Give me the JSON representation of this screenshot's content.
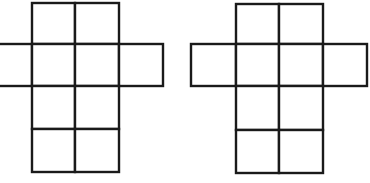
{
  "diagram": {
    "stroke_color": "#1a1a1a",
    "background_color": "#ffffff",
    "figures": [
      {
        "name": "net-left",
        "cells": [
          {
            "x": 32,
            "y": 3,
            "w": 43,
            "h": 41
          },
          {
            "x": 75,
            "y": 3,
            "w": 44,
            "h": 41
          },
          {
            "x": -2,
            "y": 44,
            "w": 34,
            "h": 42
          },
          {
            "x": 32,
            "y": 44,
            "w": 43,
            "h": 42
          },
          {
            "x": 75,
            "y": 44,
            "w": 44,
            "h": 42
          },
          {
            "x": 119,
            "y": 44,
            "w": 44,
            "h": 42
          },
          {
            "x": 32,
            "y": 86,
            "w": 43,
            "h": 43
          },
          {
            "x": 75,
            "y": 86,
            "w": 44,
            "h": 43
          },
          {
            "x": 32,
            "y": 129,
            "w": 43,
            "h": 43
          },
          {
            "x": 75,
            "y": 129,
            "w": 44,
            "h": 43
          }
        ]
      },
      {
        "name": "net-right",
        "cells": [
          {
            "x": 236,
            "y": 4,
            "w": 43,
            "h": 40
          },
          {
            "x": 279,
            "y": 4,
            "w": 44,
            "h": 40
          },
          {
            "x": 191,
            "y": 44,
            "w": 45,
            "h": 42
          },
          {
            "x": 236,
            "y": 44,
            "w": 43,
            "h": 42
          },
          {
            "x": 279,
            "y": 44,
            "w": 44,
            "h": 42
          },
          {
            "x": 323,
            "y": 44,
            "w": 44,
            "h": 42
          },
          {
            "x": 236,
            "y": 86,
            "w": 43,
            "h": 44
          },
          {
            "x": 279,
            "y": 86,
            "w": 44,
            "h": 44
          },
          {
            "x": 236,
            "y": 130,
            "w": 43,
            "h": 43
          },
          {
            "x": 279,
            "y": 130,
            "w": 44,
            "h": 43
          }
        ]
      }
    ]
  }
}
